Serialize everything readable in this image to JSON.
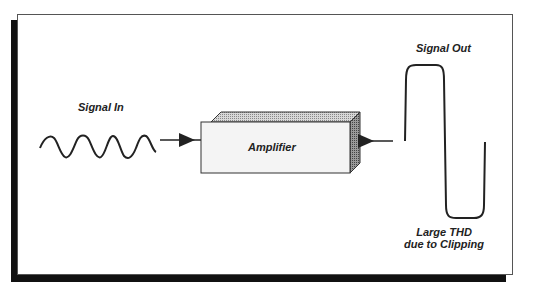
{
  "diagram": {
    "labels": {
      "signal_in": "Signal In",
      "amplifier": "Amplifier",
      "signal_out": "Signal Out",
      "thd_line1": "Large THD",
      "thd_line2": "due to Clipping"
    },
    "nodes": [
      {
        "id": "signal-in",
        "type": "sine-wave",
        "label": "Signal In"
      },
      {
        "id": "amplifier",
        "type": "3d-block",
        "label": "Amplifier"
      },
      {
        "id": "signal-out",
        "type": "clipped-wave",
        "label": "Signal Out"
      }
    ],
    "edges": [
      {
        "from": "signal-in",
        "to": "amplifier",
        "style": "arrow"
      },
      {
        "from": "amplifier",
        "to": "signal-out",
        "style": "arrow"
      }
    ],
    "colors": {
      "stroke": "#222222",
      "box_face": "#f4f4f4",
      "box_top": "#bdbdbd",
      "box_side": "#8a8a8a",
      "shadow": "#111111"
    }
  }
}
